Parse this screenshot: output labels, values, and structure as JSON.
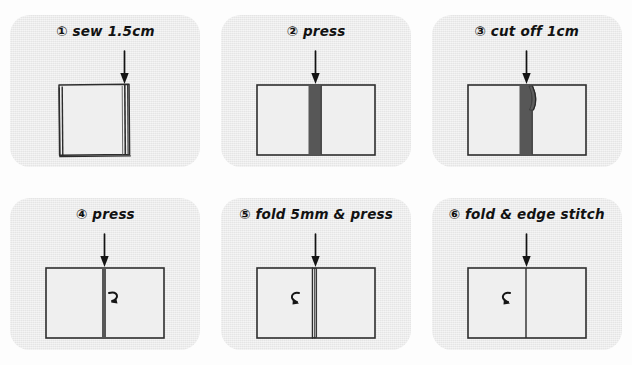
{
  "document": {
    "title": "Hand-drawn sewing instruction diagram",
    "type": "illustrated-step-sequence",
    "panel_count": 6,
    "columns": 3,
    "rows": 2
  },
  "colors": {
    "page_background": "#fdfdfd",
    "card_background": "#ececec",
    "ink": "#1a1a1a",
    "seam_dark": "#575757",
    "fabric_fill": "#eeeeee"
  },
  "panels": [
    {
      "number": "①",
      "caption": "sew 1.5cm",
      "full_caption": "① sew 1.5cm",
      "shape": "portrait-rectangle",
      "arrow": "down-arrow",
      "seam": "right-edge-double-line",
      "curl_arrow": null
    },
    {
      "number": "②",
      "caption": "press",
      "full_caption": "② press",
      "shape": "landscape-rectangle",
      "arrow": "down-arrow",
      "seam": "wide-dark-strip",
      "curl_arrow": null
    },
    {
      "number": "③",
      "caption": "cut off 1cm",
      "full_caption": "③ cut off 1cm",
      "shape": "landscape-rectangle",
      "arrow": "down-arrow",
      "seam": "wide-dark-strip-with-cut-flap",
      "curl_arrow": null
    },
    {
      "number": "④",
      "caption": "press",
      "full_caption": "④ press",
      "shape": "landscape-rectangle",
      "arrow": "down-arrow",
      "seam": "narrow-dark-line",
      "curl_arrow": "curl-right"
    },
    {
      "number": "⑤",
      "caption": "fold 5mm & press",
      "full_caption": "⑤ fold 5mm & press",
      "shape": "landscape-rectangle",
      "arrow": "down-arrow",
      "seam": "thin-folded-edge",
      "curl_arrow": "curl-left"
    },
    {
      "number": "⑥",
      "caption": "fold & edge stitch",
      "full_caption": "⑥ fold & edge stitch",
      "shape": "landscape-rectangle",
      "arrow": "down-arrow",
      "seam": "single-stitch-line",
      "curl_arrow": "curl-left"
    }
  ]
}
